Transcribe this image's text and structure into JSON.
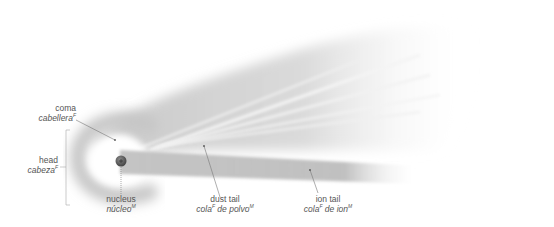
{
  "diagram": {
    "colors": {
      "background": "#ffffff",
      "coma": "#c8c8c8",
      "dust_tail": "#d8d8d8",
      "ion_tail": "#b9b9b9",
      "nucleus": "#555555",
      "leader_line": "#666666",
      "label_text": "#555555"
    },
    "labels": [
      {
        "id": "coma",
        "en": "coma",
        "es": "cabellera",
        "gender": "F"
      },
      {
        "id": "head",
        "en": "head",
        "es": "cabeza",
        "gender": "F"
      },
      {
        "id": "nucleus",
        "en": "nucleus",
        "es": "núcleo",
        "gender": "M"
      },
      {
        "id": "dust_tail",
        "en": "dust tail",
        "es_main": "cola",
        "es_main_gender": "F",
        "es_rest": " de polvo",
        "gender": "M"
      },
      {
        "id": "ion_tail",
        "en": "ion tail",
        "es_main": "cola",
        "es_main_gender": "F",
        "es_rest": " de ion",
        "gender": "M"
      }
    ]
  }
}
